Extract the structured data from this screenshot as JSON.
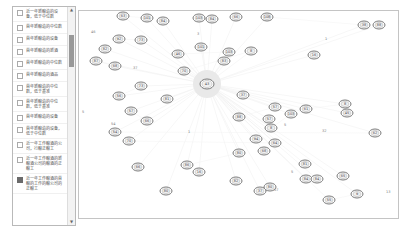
{
  "sidebar": {
    "items": [
      {
        "label": "近一年新酿造的设备，低于中位数",
        "checked": false
      },
      {
        "label": "首年新酿造的中位数",
        "checked": false
      },
      {
        "label": "首年新酿造的设备",
        "checked": false
      },
      {
        "label": "首年新酿造的新酒",
        "checked": false
      },
      {
        "label": "首年新酿造的中位数",
        "checked": false
      },
      {
        "label": "首年新酿造的酒品",
        "checked": false
      },
      {
        "label": "首年新酿造的中位数，低于基准",
        "checked": false
      },
      {
        "label": "首年新酿造的中位数，低于基准",
        "checked": false
      },
      {
        "label": "首年新酿造的设备",
        "checked": false
      },
      {
        "label": "首年新酿造的设备，低于中位数",
        "checked": false
      },
      {
        "label": "近一年工作酿酒的公司，行酿正酿工",
        "checked": false
      },
      {
        "label": "近一年工作酿酒的新酿酒公司的酿酒的正酿工",
        "checked": false
      },
      {
        "label": "近一年工作酿酒的首酿的工作的酿公司的正酿工",
        "checked": true
      }
    ],
    "scroll_up": "▲",
    "scroll_down": "▼"
  },
  "graph": {
    "hub": {
      "x": 128,
      "y": 73,
      "label": "43"
    },
    "nodes": [
      {
        "x": 44,
        "y": 5,
        "label": "63"
      },
      {
        "x": 68,
        "y": 7,
        "label": "101"
      },
      {
        "x": 84,
        "y": 10,
        "label": "84"
      },
      {
        "x": 120,
        "y": 7,
        "label": "103"
      },
      {
        "x": 133,
        "y": 8,
        "label": "84"
      },
      {
        "x": 157,
        "y": 6,
        "label": "66"
      },
      {
        "x": 188,
        "y": 6,
        "label": "108"
      },
      {
        "x": 285,
        "y": 14,
        "label": "38"
      },
      {
        "x": 300,
        "y": 14,
        "label": "88"
      },
      {
        "x": 40,
        "y": 28,
        "label": "92"
      },
      {
        "x": 62,
        "y": 29,
        "label": "73"
      },
      {
        "x": 26,
        "y": 38,
        "label": "82"
      },
      {
        "x": 17,
        "y": 50,
        "label": "87"
      },
      {
        "x": 36,
        "y": 55,
        "label": "68"
      },
      {
        "x": 122,
        "y": 36,
        "label": "101"
      },
      {
        "x": 99,
        "y": 43,
        "label": "46"
      },
      {
        "x": 150,
        "y": 41,
        "label": "103"
      },
      {
        "x": 145,
        "y": 50,
        "label": "83"
      },
      {
        "x": 172,
        "y": 40,
        "label": "8"
      },
      {
        "x": 105,
        "y": 60,
        "label": "70"
      },
      {
        "x": 235,
        "y": 44,
        "label": "16"
      },
      {
        "x": 40,
        "y": 85,
        "label": "56"
      },
      {
        "x": 62,
        "y": 75,
        "label": "73"
      },
      {
        "x": 88,
        "y": 88,
        "label": "81"
      },
      {
        "x": 52,
        "y": 100,
        "label": "57"
      },
      {
        "x": 68,
        "y": 110,
        "label": "66"
      },
      {
        "x": 164,
        "y": 84,
        "label": "37"
      },
      {
        "x": 160,
        "y": 106,
        "label": "88"
      },
      {
        "x": 196,
        "y": 96,
        "label": "57"
      },
      {
        "x": 190,
        "y": 108,
        "label": "57"
      },
      {
        "x": 212,
        "y": 103,
        "label": "103"
      },
      {
        "x": 192,
        "y": 117,
        "label": "8"
      },
      {
        "x": 177,
        "y": 128,
        "label": "94"
      },
      {
        "x": 227,
        "y": 98,
        "label": "61"
      },
      {
        "x": 266,
        "y": 93,
        "label": "8"
      },
      {
        "x": 268,
        "y": 102,
        "label": "45"
      },
      {
        "x": 50,
        "y": 130,
        "label": "70"
      },
      {
        "x": 196,
        "y": 132,
        "label": "64"
      },
      {
        "x": 226,
        "y": 153,
        "label": "81"
      },
      {
        "x": 296,
        "y": 122,
        "label": "62"
      },
      {
        "x": 36,
        "y": 121,
        "label": "54"
      },
      {
        "x": 59,
        "y": 156,
        "label": "66"
      },
      {
        "x": 108,
        "y": 154,
        "label": "86"
      },
      {
        "x": 160,
        "y": 142,
        "label": "80"
      },
      {
        "x": 185,
        "y": 140,
        "label": "68"
      },
      {
        "x": 227,
        "y": 168,
        "label": "84"
      },
      {
        "x": 238,
        "y": 168,
        "label": "84"
      },
      {
        "x": 264,
        "y": 165,
        "label": "65"
      },
      {
        "x": 250,
        "y": 189,
        "label": "55"
      },
      {
        "x": 278,
        "y": 183,
        "label": "9"
      },
      {
        "x": 157,
        "y": 170,
        "label": "82"
      },
      {
        "x": 181,
        "y": 180,
        "label": "37"
      },
      {
        "x": 191,
        "y": 176,
        "label": "80"
      },
      {
        "x": 120,
        "y": 161,
        "label": "16"
      },
      {
        "x": 87,
        "y": 180,
        "label": "80"
      }
    ],
    "small_labels": [
      {
        "x": 12,
        "y": 22,
        "label": "46"
      },
      {
        "x": 118,
        "y": 24,
        "label": "3"
      },
      {
        "x": 54,
        "y": 58,
        "label": "37"
      },
      {
        "x": 3,
        "y": 102,
        "label": "5"
      },
      {
        "x": 32,
        "y": 114,
        "label": "54"
      },
      {
        "x": 109,
        "y": 122,
        "label": "1"
      },
      {
        "x": 205,
        "y": 115,
        "label": "5"
      },
      {
        "x": 243,
        "y": 121,
        "label": "32"
      },
      {
        "x": 212,
        "y": 162,
        "label": "5"
      },
      {
        "x": 307,
        "y": 182,
        "label": "13"
      },
      {
        "x": 195,
        "y": 180,
        "label": "57"
      },
      {
        "x": 246,
        "y": 29,
        "label": "1"
      }
    ]
  }
}
